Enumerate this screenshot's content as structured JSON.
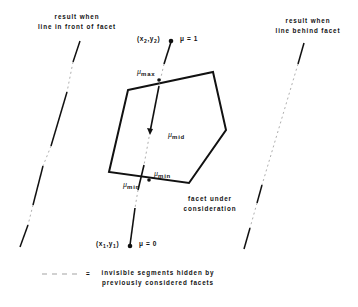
{
  "diagram": {
    "left_caption": {
      "line1": "result when",
      "line2": "line in front of facet"
    },
    "right_caption": {
      "line1": "result when",
      "line2": "line behind facet"
    },
    "endpoint_top": {
      "coord_x": "x",
      "coord_x_sub": "2",
      "coord_y": "y",
      "coord_y_sub": "2",
      "param": "μ = 1"
    },
    "endpoint_bottom": {
      "coord_x": "x",
      "coord_x_sub": "1",
      "coord_y": "y",
      "coord_y_sub": "1",
      "param": "μ = 0"
    },
    "labels": {
      "mu": "μ",
      "max": "max",
      "mid": "mid",
      "min": "min"
    },
    "facet_caption": {
      "line1": "facet under",
      "line2": "consideration"
    },
    "legend": {
      "symbol": "= ",
      "line1": "invisible segments hidden by",
      "line2": "previously considered facets"
    },
    "colors": {
      "stroke": "#111111",
      "hidden": "#999999",
      "background": "#ffffff"
    }
  }
}
